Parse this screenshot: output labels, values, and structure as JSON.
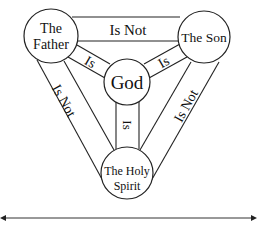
{
  "diagram": {
    "nodes": {
      "father": {
        "line1": "The",
        "line2": "Father"
      },
      "son": {
        "label": "The Son"
      },
      "god": {
        "label": "God"
      },
      "spirit": {
        "line1": "The Holy",
        "line2": "Spirit"
      }
    },
    "edges": {
      "father_son": "Is Not",
      "father_spirit": "Is Not",
      "son_spirit": "Is Not",
      "father_god": "Is",
      "son_god": "Is",
      "spirit_god": "Is"
    },
    "colors": {
      "stroke": "#222222",
      "background": "#ffffff"
    }
  }
}
